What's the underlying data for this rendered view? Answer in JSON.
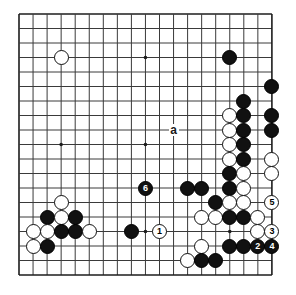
{
  "diagram": {
    "type": "go-board-diagram",
    "board_size": 19,
    "geometry": {
      "origin_x": 19,
      "origin_y": 14,
      "step_x": 14.05,
      "step_y": 14.5,
      "stone_diameter": 15,
      "line_color": "#3a3a3a",
      "border_color": "#1c1c1c",
      "background": "#ffffff"
    },
    "star_points": [
      {
        "col": 3,
        "row": 3
      },
      {
        "col": 9,
        "row": 3
      },
      {
        "col": 15,
        "row": 3
      },
      {
        "col": 3,
        "row": 9
      },
      {
        "col": 9,
        "row": 9
      },
      {
        "col": 15,
        "row": 9
      },
      {
        "col": 3,
        "row": 15
      },
      {
        "col": 9,
        "row": 15
      },
      {
        "col": 15,
        "row": 15
      }
    ],
    "stones": [
      {
        "color": "white",
        "col": 3,
        "row": 3
      },
      {
        "color": "black",
        "col": 15,
        "row": 3
      },
      {
        "color": "black",
        "col": 18,
        "row": 5
      },
      {
        "color": "black",
        "col": 16,
        "row": 6
      },
      {
        "color": "white",
        "col": 15,
        "row": 7
      },
      {
        "color": "black",
        "col": 16,
        "row": 7
      },
      {
        "color": "black",
        "col": 18,
        "row": 7
      },
      {
        "color": "white",
        "col": 15,
        "row": 8
      },
      {
        "color": "black",
        "col": 16,
        "row": 8
      },
      {
        "color": "black",
        "col": 18,
        "row": 8
      },
      {
        "color": "white",
        "col": 15,
        "row": 9
      },
      {
        "color": "black",
        "col": 16,
        "row": 9
      },
      {
        "color": "white",
        "col": 15,
        "row": 10
      },
      {
        "color": "black",
        "col": 16,
        "row": 10
      },
      {
        "color": "white",
        "col": 18,
        "row": 10
      },
      {
        "color": "black",
        "col": 15,
        "row": 11
      },
      {
        "color": "white",
        "col": 16,
        "row": 11
      },
      {
        "color": "white",
        "col": 18,
        "row": 11
      },
      {
        "color": "black",
        "col": 15,
        "row": 12
      },
      {
        "color": "white",
        "col": 16,
        "row": 12
      },
      {
        "color": "black",
        "col": 12,
        "row": 12
      },
      {
        "color": "black",
        "col": 13,
        "row": 12
      },
      {
        "color": "black",
        "col": 14,
        "row": 13
      },
      {
        "color": "white",
        "col": 15,
        "row": 13
      },
      {
        "color": "white",
        "col": 16,
        "row": 13
      },
      {
        "color": "white",
        "col": 13,
        "row": 14
      },
      {
        "color": "white",
        "col": 14,
        "row": 14
      },
      {
        "color": "black",
        "col": 15,
        "row": 14
      },
      {
        "color": "black",
        "col": 16,
        "row": 14
      },
      {
        "color": "white",
        "col": 17,
        "row": 14
      },
      {
        "color": "black",
        "col": 8,
        "row": 15
      },
      {
        "color": "white",
        "col": 17,
        "row": 15
      },
      {
        "color": "white",
        "col": 13,
        "row": 16
      },
      {
        "color": "black",
        "col": 15,
        "row": 16
      },
      {
        "color": "black",
        "col": 16,
        "row": 16
      },
      {
        "color": "white",
        "col": 3,
        "row": 13
      },
      {
        "color": "black",
        "col": 2,
        "row": 14
      },
      {
        "color": "white",
        "col": 3,
        "row": 14
      },
      {
        "color": "black",
        "col": 4,
        "row": 14
      },
      {
        "color": "white",
        "col": 1,
        "row": 15
      },
      {
        "color": "white",
        "col": 2,
        "row": 15
      },
      {
        "color": "black",
        "col": 3,
        "row": 15
      },
      {
        "color": "black",
        "col": 4,
        "row": 15
      },
      {
        "color": "white",
        "col": 5,
        "row": 15
      },
      {
        "color": "white",
        "col": 1,
        "row": 16
      },
      {
        "color": "black",
        "col": 2,
        "row": 16
      },
      {
        "color": "white",
        "col": 12,
        "row": 17
      },
      {
        "color": "black",
        "col": 13,
        "row": 17
      },
      {
        "color": "black",
        "col": 14,
        "row": 17
      }
    ],
    "move_markers": [
      {
        "label": "1",
        "col": 10,
        "row": 15,
        "color": "white"
      },
      {
        "label": "2",
        "col": 17,
        "row": 16,
        "color": "black"
      },
      {
        "label": "3",
        "col": 18,
        "row": 15,
        "color": "white"
      },
      {
        "label": "4",
        "col": 18,
        "row": 16,
        "color": "black"
      },
      {
        "label": "5",
        "col": 18,
        "row": 13,
        "color": "white"
      },
      {
        "label": "6",
        "col": 9,
        "row": 12,
        "color": "black"
      }
    ],
    "point_labels": [
      {
        "label": "a",
        "col": 11,
        "row": 8
      }
    ]
  }
}
